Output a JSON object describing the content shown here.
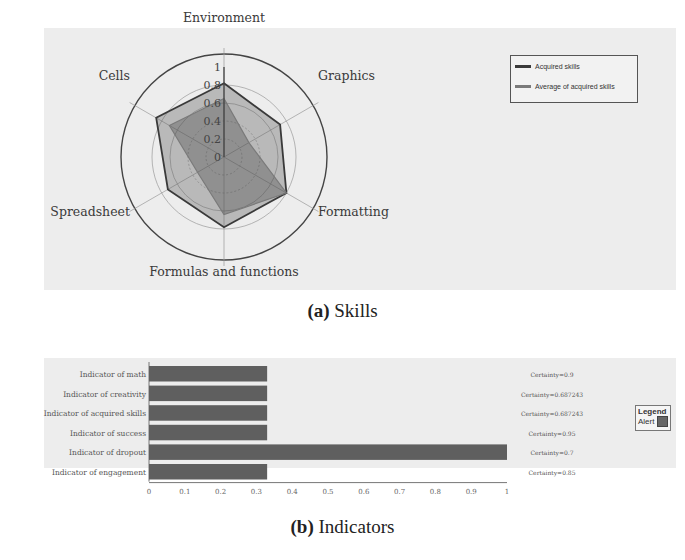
{
  "captions": {
    "a_label": "(a)",
    "a_text": " Skills",
    "b_label": "(b)",
    "b_text": " Indicators"
  },
  "chart_data": [
    {
      "type": "radar",
      "title": "Skills",
      "axes": [
        "Environment",
        "Graphics",
        "Formatting",
        "Formulas and functions",
        "Spreadsheet",
        "Cells"
      ],
      "radial_ticks": [
        "0",
        "0.2",
        "0.4",
        "0.6",
        "0.8",
        "1"
      ],
      "rlim": [
        0,
        1
      ],
      "series": [
        {
          "name": "Acquired skills",
          "values": [
            0.82,
            0.72,
            0.8,
            0.78,
            0.72,
            0.87
          ],
          "color": "#3a3a3a"
        },
        {
          "name": "Average of acquired skills",
          "values": [
            0.65,
            0.32,
            0.8,
            0.64,
            0.34,
            0.7
          ],
          "color": "#7a7a7a"
        }
      ],
      "legend_position": "top-right"
    },
    {
      "type": "bar",
      "orientation": "horizontal",
      "title": "Indicators",
      "categories": [
        "Indicator of math",
        "Indicator of creativity",
        "Indicator of acquired skills",
        "Indicator of success",
        "Indicator of dropout",
        "Indicator of engagement"
      ],
      "values": [
        0.33,
        0.33,
        0.33,
        0.33,
        1.0,
        0.33
      ],
      "annotations": [
        "Certainty=0.9",
        "Certainty=0.687243",
        "Certainty=0.687243",
        "Certainty=0.95",
        "Certainty=0.7",
        "Certainty=0.85"
      ],
      "xticks": [
        "0",
        "0.1",
        "0.2",
        "0.3",
        "0.4",
        "0.5",
        "0.6",
        "0.7",
        "0.8",
        "0.9",
        "1"
      ],
      "xlim": [
        0,
        1
      ],
      "legend": {
        "title": "Legend",
        "entries": [
          {
            "name": "Alert",
            "color": "#666666"
          }
        ]
      },
      "bar_color": "#5f5f5f"
    }
  ],
  "legend_a": {
    "items": [
      "Acquired skills",
      "Average of acquired skills"
    ]
  },
  "legend_b": {
    "title": "Legend",
    "item": "Alert"
  }
}
